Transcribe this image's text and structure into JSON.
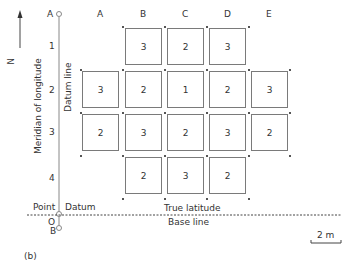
{
  "north_arrow": {
    "label": "N"
  },
  "axis": {
    "top_point": "A",
    "bottom_point": "B",
    "origin_label": "O",
    "point_label": "Point",
    "datum_label": "Datum",
    "datum_line_label": "Datum line",
    "meridian_label": "Meridian of longitude",
    "true_latitude_label": "True latitude",
    "base_line_label": "Base line"
  },
  "columns": [
    "A",
    "B",
    "C",
    "D",
    "E"
  ],
  "rows": [
    "1",
    "2",
    "3",
    "4"
  ],
  "grid": [
    {
      "row": "1",
      "cells": [
        null,
        "3",
        "2",
        "3",
        null
      ]
    },
    {
      "row": "2",
      "cells": [
        "3",
        "2",
        "1",
        "2",
        "3"
      ]
    },
    {
      "row": "3",
      "cells": [
        "2",
        "3",
        "2",
        "3",
        "2"
      ]
    },
    {
      "row": "4",
      "cells": [
        null,
        "2",
        "3",
        "2",
        null
      ]
    }
  ],
  "scale_bar": {
    "label": "2 m"
  },
  "caption": "(b)"
}
